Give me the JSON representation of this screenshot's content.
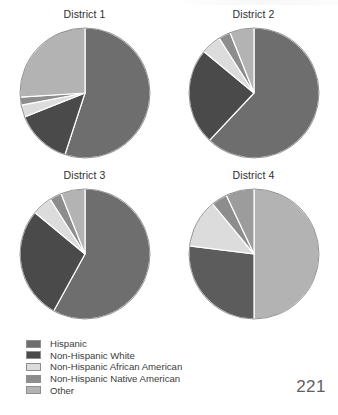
{
  "page": {
    "number": "221"
  },
  "legend": {
    "items": [
      {
        "label": "Hispanic",
        "color": "#6e6e6e"
      },
      {
        "label": "Non-Hispanic White",
        "color": "#4a4a4a"
      },
      {
        "label": "Non-Hispanic African American",
        "color": "#dcdcdc"
      },
      {
        "label": "Non-Hispanic Native American",
        "color": "#8d8d8d"
      },
      {
        "label": "Other",
        "color": "#b3b3b3"
      }
    ]
  },
  "chart_data": [
    {
      "type": "pie",
      "title": "District 1",
      "categories": [
        "Hispanic",
        "Non-Hispanic White",
        "Non-Hispanic African American",
        "Non-Hispanic Native American",
        "Other"
      ],
      "values": [
        55,
        14,
        3,
        2,
        26
      ],
      "colors": [
        "#6e6e6e",
        "#4a4a4a",
        "#dcdcdc",
        "#8d8d8d",
        "#b3b3b3"
      ],
      "start_angle": 0,
      "direction": "clockwise",
      "legend_position": "bottom-left"
    },
    {
      "type": "pie",
      "title": "District 2",
      "categories": [
        "Hispanic",
        "Non-Hispanic White",
        "Non-Hispanic African American",
        "Non-Hispanic Native American",
        "Other"
      ],
      "values": [
        62,
        24,
        5,
        3,
        6
      ],
      "colors": [
        "#6e6e6e",
        "#4a4a4a",
        "#dcdcdc",
        "#8d8d8d",
        "#b3b3b3"
      ],
      "start_angle": 0,
      "direction": "clockwise",
      "legend_position": "bottom-left"
    },
    {
      "type": "pie",
      "title": "District 3",
      "categories": [
        "Hispanic",
        "Non-Hispanic White",
        "Non-Hispanic African American",
        "Non-Hispanic Native American",
        "Other"
      ],
      "values": [
        58,
        28,
        5,
        3,
        6
      ],
      "colors": [
        "#6e6e6e",
        "#4a4a4a",
        "#dcdcdc",
        "#8d8d8d",
        "#b3b3b3"
      ],
      "start_angle": 0,
      "direction": "clockwise",
      "legend_position": "bottom-left"
    },
    {
      "type": "pie",
      "title": "District 4",
      "categories": [
        "Hispanic",
        "Non-Hispanic White",
        "Non-Hispanic African American",
        "Non-Hispanic Native American",
        "Other"
      ],
      "values": [
        50,
        27,
        12,
        4,
        7
      ],
      "colors": [
        "#b3b3b3",
        "#5c5c5c",
        "#dcdcdc",
        "#8d8d8d",
        "#9c9c9c"
      ],
      "start_angle": 0,
      "direction": "clockwise",
      "legend_position": "bottom-left"
    }
  ]
}
